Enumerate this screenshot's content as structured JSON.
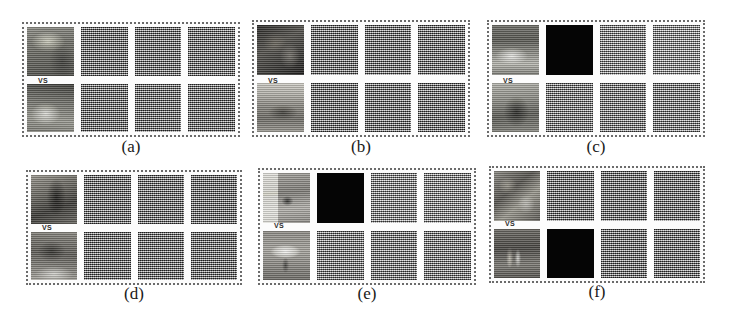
{
  "figure": {
    "background_color": "#ffffff",
    "caption_color": "#1a1a1a",
    "panel_border_color": "#6b6b6b",
    "vs_text": "VS",
    "grid_rows": 2,
    "grid_cols": 3
  },
  "panels": [
    {
      "id": "a",
      "caption": "(a)",
      "tiles": {
        "row1": [
          {
            "kind": "photo",
            "style": "ph-a1",
            "name": "photo-top"
          },
          {
            "kind": "map",
            "shade": "dark",
            "name": "saliency-map-1"
          },
          {
            "kind": "map",
            "shade": "dark",
            "name": "saliency-map-2"
          },
          {
            "kind": "map",
            "shade": "dark",
            "name": "saliency-map-3"
          }
        ],
        "row2": [
          {
            "kind": "photo",
            "style": "ph-a2",
            "name": "photo-bottom"
          },
          {
            "kind": "map",
            "shade": "dark",
            "name": "saliency-map-4"
          },
          {
            "kind": "map",
            "shade": "dark",
            "name": "saliency-map-5"
          },
          {
            "kind": "map",
            "shade": "dark",
            "name": "saliency-map-6"
          }
        ]
      }
    },
    {
      "id": "b",
      "caption": "(b)",
      "tiles": {
        "row1": [
          {
            "kind": "photo",
            "style": "ph-b1",
            "name": "photo-top"
          },
          {
            "kind": "map",
            "shade": "dark",
            "name": "saliency-map-1"
          },
          {
            "kind": "map",
            "shade": "dark",
            "name": "saliency-map-2"
          },
          {
            "kind": "map",
            "shade": "dark",
            "name": "saliency-map-3"
          }
        ],
        "row2": [
          {
            "kind": "photo",
            "style": "ph-b2",
            "name": "photo-bottom"
          },
          {
            "kind": "map",
            "shade": "dark",
            "name": "saliency-map-4"
          },
          {
            "kind": "map",
            "shade": "dark",
            "name": "saliency-map-5"
          },
          {
            "kind": "map",
            "shade": "dark",
            "name": "saliency-map-6"
          }
        ]
      }
    },
    {
      "id": "c",
      "caption": "(c)",
      "tiles": {
        "row1": [
          {
            "kind": "photo",
            "style": "ph-c1",
            "name": "photo-top"
          },
          {
            "kind": "black",
            "name": "blank-map-1"
          },
          {
            "kind": "map",
            "shade": "light",
            "name": "saliency-map-1"
          },
          {
            "kind": "map",
            "shade": "lighter",
            "name": "saliency-map-2"
          }
        ],
        "row2": [
          {
            "kind": "photo",
            "style": "ph-c2",
            "name": "photo-bottom"
          },
          {
            "kind": "map",
            "shade": "mid",
            "name": "saliency-map-3"
          },
          {
            "kind": "map",
            "shade": "mid",
            "name": "saliency-map-4"
          },
          {
            "kind": "map",
            "shade": "mid",
            "name": "saliency-map-5"
          }
        ]
      }
    },
    {
      "id": "d",
      "caption": "(d)",
      "tiles": {
        "row1": [
          {
            "kind": "photo",
            "style": "ph-d1",
            "name": "photo-top"
          },
          {
            "kind": "map",
            "shade": "dark",
            "name": "saliency-map-1"
          },
          {
            "kind": "map",
            "shade": "dark",
            "name": "saliency-map-2"
          },
          {
            "kind": "map",
            "shade": "dark",
            "name": "saliency-map-3"
          }
        ],
        "row2": [
          {
            "kind": "photo",
            "style": "ph-d2",
            "name": "photo-bottom"
          },
          {
            "kind": "map",
            "shade": "dark",
            "name": "saliency-map-4"
          },
          {
            "kind": "map",
            "shade": "dark",
            "name": "saliency-map-5"
          },
          {
            "kind": "map",
            "shade": "dark",
            "name": "saliency-map-6"
          }
        ]
      }
    },
    {
      "id": "e",
      "caption": "(e)",
      "tiles": {
        "row1": [
          {
            "kind": "photo",
            "style": "ph-e1",
            "name": "photo-top"
          },
          {
            "kind": "black",
            "name": "blank-map-1"
          },
          {
            "kind": "map",
            "shade": "light",
            "name": "saliency-map-1"
          },
          {
            "kind": "map",
            "shade": "light",
            "name": "saliency-map-2"
          }
        ],
        "row2": [
          {
            "kind": "photo",
            "style": "ph-e2",
            "name": "photo-bottom"
          },
          {
            "kind": "map",
            "shade": "mid",
            "name": "saliency-map-3"
          },
          {
            "kind": "map",
            "shade": "mid",
            "name": "saliency-map-4"
          },
          {
            "kind": "map",
            "shade": "mid",
            "name": "saliency-map-5"
          }
        ]
      }
    },
    {
      "id": "f",
      "caption": "(f)",
      "tiles": {
        "row1": [
          {
            "kind": "photo",
            "style": "ph-f1",
            "name": "photo-top"
          },
          {
            "kind": "map",
            "shade": "dark",
            "name": "saliency-map-1"
          },
          {
            "kind": "map",
            "shade": "dark",
            "name": "saliency-map-2"
          },
          {
            "kind": "map",
            "shade": "dark",
            "name": "saliency-map-3"
          }
        ],
        "row2": [
          {
            "kind": "photo",
            "style": "ph-f2",
            "name": "photo-bottom"
          },
          {
            "kind": "black",
            "name": "blank-map-1"
          },
          {
            "kind": "map",
            "shade": "dark",
            "name": "saliency-map-4"
          },
          {
            "kind": "map",
            "shade": "dark",
            "name": "saliency-map-5"
          }
        ]
      }
    }
  ],
  "layout": {
    "panel_boxes": [
      {
        "id": "a",
        "left": 22,
        "top": 22,
        "width": 218,
        "height": 115,
        "caption_left": 22,
        "caption_top": 138,
        "caption_width": 218,
        "vs_left": 38,
        "vs_top": 77
      },
      {
        "id": "b",
        "left": 252,
        "top": 20,
        "width": 218,
        "height": 117,
        "caption_left": 252,
        "caption_top": 138,
        "caption_width": 218,
        "vs_left": 268,
        "vs_top": 77
      },
      {
        "id": "c",
        "left": 487,
        "top": 20,
        "width": 218,
        "height": 117,
        "caption_left": 487,
        "caption_top": 138,
        "caption_width": 218,
        "vs_left": 503,
        "vs_top": 77
      },
      {
        "id": "d",
        "left": 26,
        "top": 170,
        "width": 216,
        "height": 115,
        "caption_left": 26,
        "caption_top": 285,
        "caption_width": 216,
        "vs_left": 42,
        "vs_top": 224
      },
      {
        "id": "e",
        "left": 258,
        "top": 168,
        "width": 218,
        "height": 117,
        "caption_left": 258,
        "caption_top": 285,
        "caption_width": 218,
        "vs_left": 274,
        "vs_top": 222
      },
      {
        "id": "f",
        "left": 489,
        "top": 166,
        "width": 216,
        "height": 117,
        "caption_left": 489,
        "caption_top": 283,
        "caption_width": 216,
        "vs_left": 505,
        "vs_top": 220
      }
    ]
  }
}
